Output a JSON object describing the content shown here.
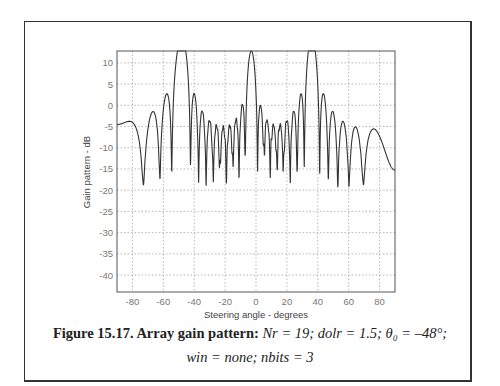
{
  "chart_data": {
    "type": "line",
    "title": "",
    "xlabel": "Steering angle - degrees",
    "ylabel": "Gain pattern - dB",
    "xlim": [
      -90,
      90
    ],
    "ylim": [
      -44,
      12.8
    ],
    "xticks": [
      -80,
      -60,
      -40,
      -20,
      0,
      20,
      40,
      60,
      80
    ],
    "yticks": [
      10,
      5,
      0,
      -5,
      -10,
      -15,
      -20,
      -25,
      -30,
      -35,
      -40
    ],
    "grid": true,
    "line_color": "#333333",
    "main_lobes": [
      {
        "angle": -48,
        "gain_db": 12.8
      },
      {
        "angle": -3,
        "gain_db": 12.8
      },
      {
        "angle": 36,
        "gain_db": 12.8
      }
    ],
    "notable_nulls": [
      {
        "angle": -83,
        "gain_db": -24
      },
      {
        "angle": -60,
        "gain_db": -32
      },
      {
        "angle": -36,
        "gain_db": -25
      },
      {
        "angle": -24,
        "gain_db": -30
      },
      {
        "angle": -11,
        "gain_db": -44
      },
      {
        "angle": 10,
        "gain_db": -30
      },
      {
        "angle": 18,
        "gain_db": -30
      },
      {
        "angle": 27,
        "gain_db": -34
      },
      {
        "angle": 50,
        "gain_db": -24
      },
      {
        "angle": 56,
        "gain_db": -29
      },
      {
        "angle": 75,
        "gain_db": -28
      }
    ],
    "edge_values": [
      {
        "angle": -90,
        "gain_db": -11.5
      },
      {
        "angle": 90,
        "gain_db": -11
      }
    ]
  },
  "caption": {
    "figure_label": "Figure 15.17. Array gain pattern:",
    "line1_params": "Nr = 19;  dolr = 1.5;  θ₀ = –48°;",
    "line2_params": "win = none;  nbits = 3"
  }
}
